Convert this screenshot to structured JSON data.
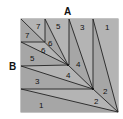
{
  "diagram": {
    "outer_labels": [
      {
        "text": "A",
        "x": 68,
        "y": 15
      },
      {
        "text": "B",
        "x": 13,
        "y": 70
      }
    ],
    "colors": {
      "fill_light": "#b4b4b4",
      "fill_dark": "#a6a6a6",
      "line": "#222222",
      "frame": "#8a8a8a"
    },
    "region_labels": [
      {
        "text": "7",
        "x": 38,
        "y": 28
      },
      {
        "text": "7",
        "x": 26,
        "y": 38
      },
      {
        "text": "6",
        "x": 50,
        "y": 44
      },
      {
        "text": "6",
        "x": 43,
        "y": 52
      },
      {
        "text": "5",
        "x": 58,
        "y": 28
      },
      {
        "text": "5",
        "x": 32,
        "y": 60
      },
      {
        "text": "4",
        "x": 77,
        "y": 64
      },
      {
        "text": "4",
        "x": 68,
        "y": 77
      },
      {
        "text": "3",
        "x": 82,
        "y": 30
      },
      {
        "text": "3",
        "x": 37,
        "y": 83
      },
      {
        "text": "2",
        "x": 104,
        "y": 92
      },
      {
        "text": "2",
        "x": 95,
        "y": 103
      },
      {
        "text": "1",
        "x": 106,
        "y": 30
      },
      {
        "text": "1",
        "x": 40,
        "y": 107
      }
    ]
  }
}
